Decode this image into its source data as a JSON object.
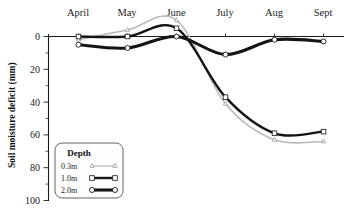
{
  "chart_data": {
    "type": "line",
    "title": "",
    "xlabel": "",
    "ylabel": "Soil moisture deficit (mm)",
    "x_tick_labels": [
      "April",
      "May",
      "June",
      "July",
      "Aug",
      "Sept"
    ],
    "y_tick_labels": [
      "0",
      "20",
      "40",
      "60",
      "80",
      "100"
    ],
    "y_ticks": [
      0,
      20,
      40,
      60,
      80,
      100
    ],
    "ylim": [
      -12,
      100
    ],
    "y_axis_inverted": true,
    "grid": false,
    "legend_position": "bottom-left",
    "legend_title": "Depth",
    "x": [
      "April",
      "May",
      "June",
      "July",
      "Aug",
      "Sept"
    ],
    "series": [
      {
        "name": "0.3m",
        "label": "0.3m",
        "color": "#b9b9b9",
        "marker": "triangle",
        "values": [
          2,
          -4,
          -10,
          41,
          63,
          64
        ]
      },
      {
        "name": "1.0m",
        "label": "1.0m",
        "color": "#141414",
        "marker": "square",
        "values": [
          0,
          0,
          -5,
          37,
          59,
          58
        ]
      },
      {
        "name": "2.0m",
        "label": "2.0m",
        "color": "#141414",
        "marker": "circle",
        "values": [
          5,
          7,
          0,
          11,
          2,
          3
        ]
      }
    ]
  },
  "axis": {
    "y_label": "Soil moisture deficit (mm)",
    "y_tick_0": "0",
    "y_tick_20": "20",
    "y_tick_40": "40",
    "y_tick_60": "60",
    "y_tick_80": "80",
    "y_tick_100": "100",
    "x_tick_april": "April",
    "x_tick_may": "May",
    "x_tick_june": "June",
    "x_tick_july": "July",
    "x_tick_aug": "Aug",
    "x_tick_sept": "Sept"
  },
  "legend": {
    "title": "Depth",
    "item_0_label": "0.3m",
    "item_1_label": "1.0m",
    "item_2_label": "2.0m"
  }
}
